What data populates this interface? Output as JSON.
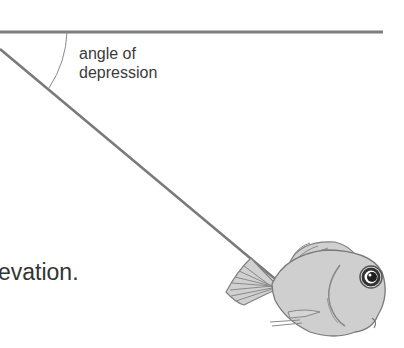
{
  "diagram": {
    "angle_label_line1": "angle of",
    "angle_label_line2": "depression",
    "caption_fragment": "evation.",
    "colors": {
      "line": "#7a7a7a",
      "text": "#3a3a3a",
      "fish_body": "#c8c8c8",
      "fish_outline": "#777777",
      "eye": "#222222"
    },
    "elements": [
      "horizontal-line",
      "sight-line",
      "angle-arc",
      "fish"
    ]
  }
}
